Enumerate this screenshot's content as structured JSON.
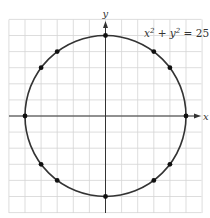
{
  "chart_data": {
    "type": "scatter",
    "title": "",
    "annotation": "x² + y² = 25",
    "curve": {
      "kind": "circle",
      "center": [
        0,
        0
      ],
      "radius": 5
    },
    "xlabel": "x",
    "ylabel": "y",
    "xlim": [
      -6,
      6
    ],
    "ylim": [
      -6,
      6
    ],
    "grid": true,
    "points": [
      {
        "x": 0,
        "y": 5
      },
      {
        "x": 3,
        "y": 4
      },
      {
        "x": 4,
        "y": 3
      },
      {
        "x": 5,
        "y": 0
      },
      {
        "x": 4,
        "y": -3
      },
      {
        "x": 3,
        "y": -4
      },
      {
        "x": 0,
        "y": -5
      },
      {
        "x": -3,
        "y": -4
      },
      {
        "x": -4,
        "y": -3
      },
      {
        "x": -5,
        "y": 0
      },
      {
        "x": -4,
        "y": 3
      },
      {
        "x": -3,
        "y": 4
      }
    ]
  },
  "labels": {
    "equation_x": "x",
    "equation_y": "y",
    "equation_exp": "2",
    "equation_rest": "= 25",
    "x_axis": "x",
    "y_axis": "y"
  }
}
